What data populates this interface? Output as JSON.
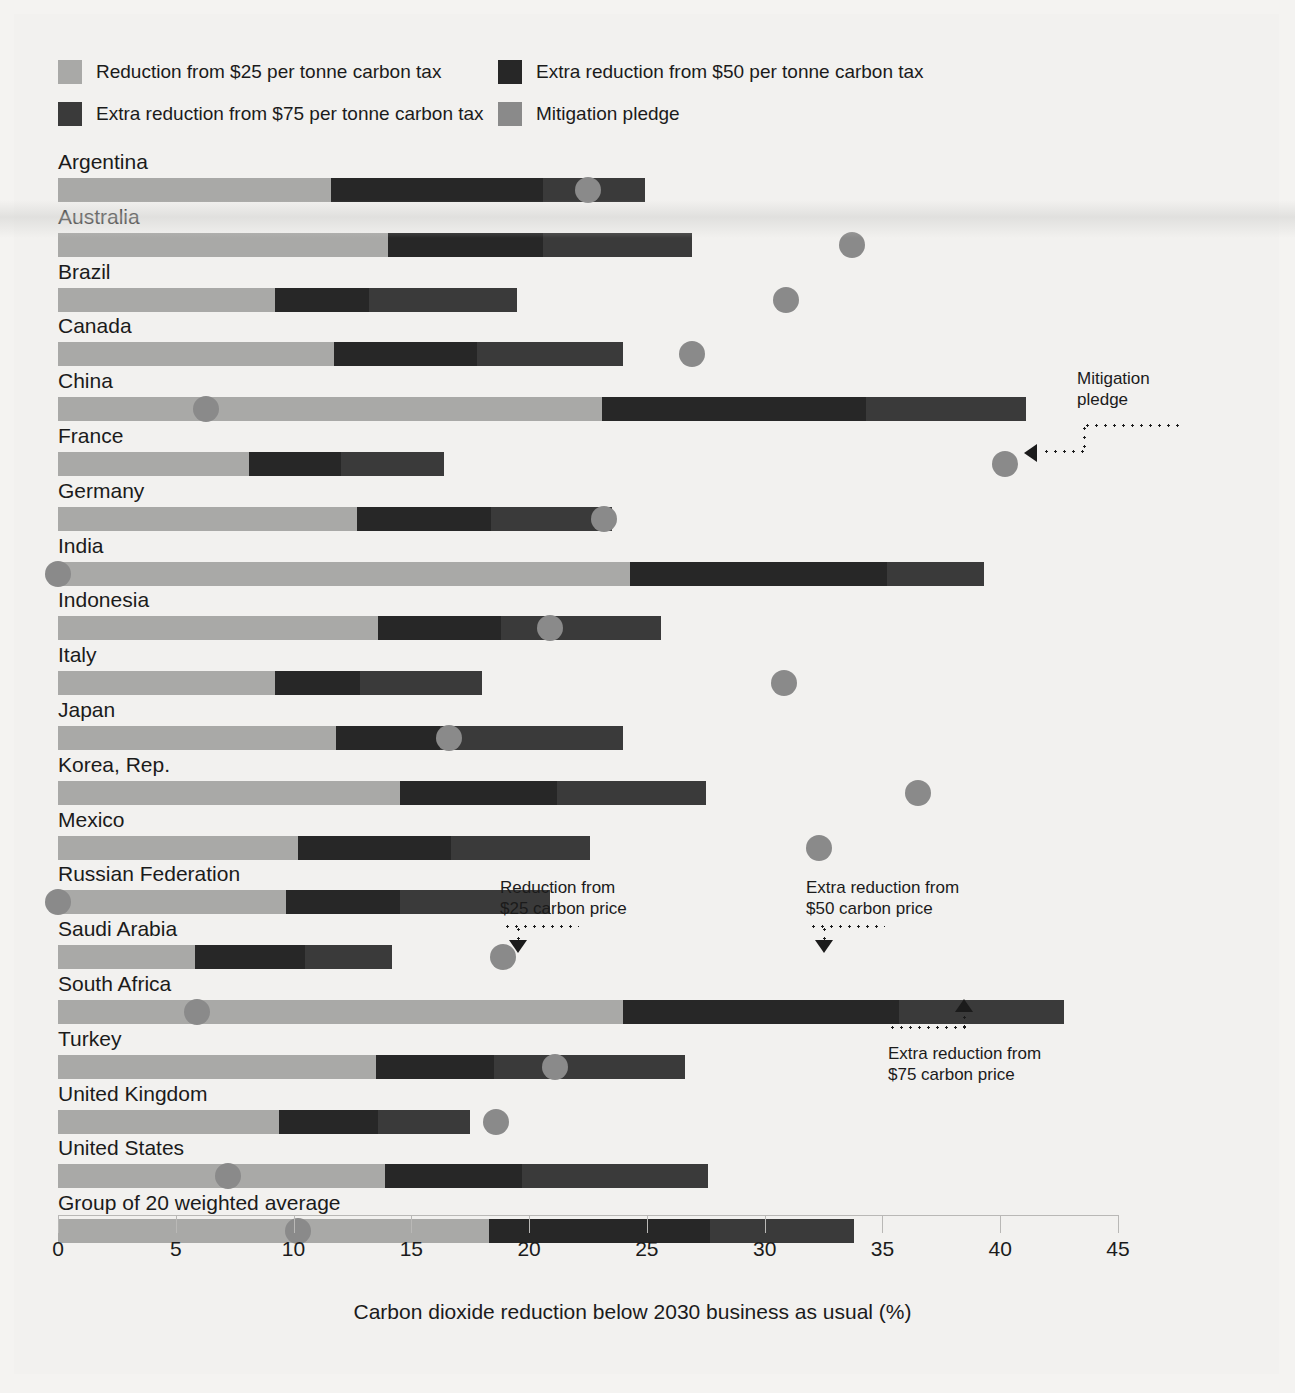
{
  "colors": {
    "background": "#f2f1ef",
    "tax25": "#a9a9a7",
    "tax50": "#272727",
    "tax75": "#4c4c4c",
    "pledge": "#8a8a8a",
    "text": "#1b1b1b",
    "axis": "#b9b8b6"
  },
  "legend": {
    "items": [
      {
        "label": "Reduction from $25 per tonne carbon tax",
        "swatch": "tax25",
        "color": "#a9a9a7"
      },
      {
        "label": "Extra reduction from $50 per tonne carbon tax",
        "swatch": "tax50",
        "color": "#272727"
      },
      {
        "label": "Extra reduction from $75 per tonne carbon tax",
        "swatch": "tax75",
        "color": "#3a3a3a"
      },
      {
        "label": "Mitigation pledge",
        "swatch": "pledge",
        "color": "#8a8a8a"
      }
    ]
  },
  "annotations": [
    {
      "id": "mitigation-pledge",
      "lines": [
        "Mitigation",
        "pledge"
      ],
      "arrow": "left"
    },
    {
      "id": "reduction-25",
      "lines": [
        "Reduction from",
        "$25 carbon price"
      ],
      "arrow": "down"
    },
    {
      "id": "extra-reduction-50",
      "lines": [
        "Extra reduction from",
        "$50 carbon price"
      ],
      "arrow": "down"
    },
    {
      "id": "extra-reduction-75",
      "lines": [
        "Extra reduction from",
        "$75 carbon price"
      ],
      "arrow": "up"
    }
  ],
  "chart_data": {
    "type": "bar",
    "orientation": "horizontal",
    "stacked": true,
    "title": "",
    "xlabel": "Carbon dioxide reduction below 2030 business as usual (%)",
    "ylabel": "",
    "xlim": [
      0,
      45
    ],
    "xticks": [
      0,
      5,
      10,
      15,
      20,
      25,
      30,
      35,
      40,
      45
    ],
    "xtick_labels": [
      "0",
      "5",
      "10",
      "15",
      "20",
      "25",
      "30",
      "35",
      "40",
      "45"
    ],
    "grid": false,
    "legend_position": "top-left",
    "categories": [
      "Argentina",
      "Australia",
      "Brazil",
      "Canada",
      "China",
      "France",
      "Germany",
      "India",
      "Indonesia",
      "Italy",
      "Japan",
      "Korea, Rep.",
      "Mexico",
      "Russian Federation",
      "Saudi Arabia",
      "South Africa",
      "Turkey",
      "United Kingdom",
      "United States",
      "Group of 20 weighted average"
    ],
    "series": [
      {
        "name": "Reduction from $25 per tonne carbon tax",
        "values": [
          11.6,
          14.0,
          9.2,
          11.7,
          23.1,
          8.1,
          12.7,
          24.3,
          13.6,
          9.2,
          11.8,
          14.5,
          10.2,
          9.7,
          5.8,
          24.0,
          13.5,
          9.4,
          13.9,
          18.3
        ]
      },
      {
        "name": "Extra reduction from $50 per tonne carbon tax",
        "values": [
          9.0,
          6.6,
          4.0,
          6.1,
          11.2,
          3.9,
          5.7,
          10.9,
          5.2,
          3.6,
          4.4,
          6.7,
          6.5,
          4.8,
          4.7,
          11.7,
          5.0,
          4.2,
          5.8,
          9.4
        ]
      },
      {
        "name": "Extra reduction from $75 per tonne carbon tax",
        "values": [
          4.3,
          6.3,
          6.3,
          6.2,
          6.8,
          4.4,
          5.1,
          4.1,
          6.8,
          5.2,
          7.8,
          6.3,
          5.9,
          6.4,
          3.7,
          7.0,
          8.1,
          3.9,
          7.9,
          6.1
        ]
      }
    ],
    "pledges": {
      "name": "Mitigation pledge",
      "values": [
        22.5,
        33.7,
        30.9,
        26.9,
        6.3,
        40.2,
        23.2,
        0.0,
        20.9,
        30.8,
        16.6,
        36.5,
        32.3,
        0.0,
        18.9,
        5.9,
        21.1,
        18.6,
        7.2,
        10.2
      ]
    }
  }
}
